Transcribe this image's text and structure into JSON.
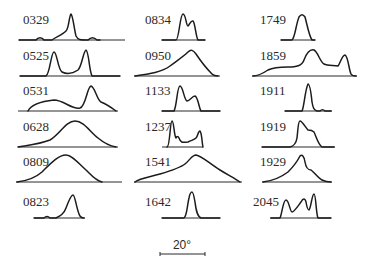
{
  "figure": {
    "type": "panel-grid",
    "scale_bar": {
      "label": "20°",
      "x1": 160,
      "x2": 205,
      "y": 254,
      "label_x": 182,
      "label_y": 249
    },
    "panels": [
      {
        "id": "0329",
        "label": "0329",
        "lx": 23,
        "ly": 24,
        "base": [
          19,
          125,
          40
        ],
        "path": "M19,40 L36,40 C38,37 42,37 44,40 L52,40 C56,37 62,35 66,31 C69,28 69,16 71,14 C73,16 74,28 76,36 C78,40 80,40 88,40 C91,37 94,37 97,40 L100,40"
      },
      {
        "id": "0525",
        "label": "0525",
        "lx": 23,
        "ly": 60,
        "base": [
          20,
          120,
          76
        ],
        "path": "M20,76 L46,76 C50,74 51,52 54,52 C57,52 58,70 62,72 C66,74 72,74 78,70 C82,66 83,52 86,50 C89,52 89,70 92,76 L120,76"
      },
      {
        "id": "0531",
        "label": "0531",
        "lx": 23,
        "ly": 95,
        "base": [
          18,
          118,
          111
        ],
        "path": "M28,111 C32,103 44,101 54,100 C64,100 72,110 80,108 C86,106 87,87 91,86 C95,87 97,100 101,102 C106,104 112,108 116,111"
      },
      {
        "id": "0628",
        "label": "0628",
        "lx": 23,
        "ly": 131,
        "base": [
          18,
          118,
          147
        ],
        "path": "M18,147 C30,145 40,144 50,140 C60,134 66,121 75,121 C84,121 90,132 98,138 C104,143 110,146 116,147"
      },
      {
        "id": "0809",
        "label": "0809",
        "lx": 23,
        "ly": 166,
        "base": [
          16,
          122,
          182
        ],
        "path": "M17,182 C26,181 34,179 42,172 C50,164 58,155 66,155 C72,155 78,163 86,170 C92,176 96,181 102,182"
      },
      {
        "id": "0823",
        "label": "0823",
        "lx": 23,
        "ly": 206,
        "base": [
          34,
          85,
          218
        ],
        "path": "M34,218 L44,218 C46,216 48,216 50,218 L56,218 C60,216 64,214 66,208 C69,200 71,195 73,195 C75,195 76,206 79,214 C80,217 82,218 84,218"
      },
      {
        "id": "0834",
        "label": "0834",
        "lx": 145,
        "ly": 24,
        "base": [
          162,
          205,
          40
        ],
        "path": "M162,40 L176,40 C179,40 180,14 183,14 C186,14 186,26 188,26 C190,24 191,20 193,21 C195,22 196,38 198,40 L205,40"
      },
      {
        "id": "0950",
        "label": "0950",
        "lx": 145,
        "ly": 60,
        "base": [
          134,
          220,
          76
        ],
        "path": "M135,76 C150,74 162,72 170,66 C178,60 184,56 188,52 C191,49 193,50 196,54 C200,60 206,68 212,74 C214,76 216,76 218,76"
      },
      {
        "id": "0950b",
        "label": "",
        "lx": 0,
        "ly": 0,
        "base": [
          0,
          0,
          0
        ],
        "path": ""
      },
      {
        "id": "1133",
        "label": "1133",
        "lx": 145,
        "ly": 95,
        "base": [
          162,
          220,
          111
        ],
        "path": "M162,111 L174,111 C177,106 177,86 180,86 C183,86 184,100 187,101 C190,101 192,96 195,96 C198,97 199,108 201,111 L220,111"
      },
      {
        "id": "1237",
        "label": "1237",
        "lx": 145,
        "ly": 131,
        "base": [
          162,
          203,
          147
        ],
        "path": "M167,147 C170,147 170,121 172,121 C174,121 174,136 176,138 C177,136 178,136 179,138 C181,144 184,142 188,142 C192,140 194,140 196,138 C198,136 198,131 200,131 C202,133 202,144 203,147"
      },
      {
        "id": "1541",
        "label": "1541",
        "lx": 145,
        "ly": 166,
        "base": [
          134,
          242,
          182
        ],
        "path": "M135,182 C140,178 150,177 160,174 C170,171 180,168 185,164 C190,160 192,155 196,155 C202,156 210,164 220,170 C228,175 234,178 240,182"
      },
      {
        "id": "1642",
        "label": "1642",
        "lx": 145,
        "ly": 206,
        "base": [
          162,
          220,
          218
        ],
        "path": "M162,218 L184,218 C187,216 187,206 189,198 C190,193 191,192 192,192 C193,192 194,196 195,202 C196,210 197,216 201,218 L220,218"
      },
      {
        "id": "1749",
        "label": "1749",
        "lx": 260,
        "ly": 24,
        "base": [
          281,
          315,
          40
        ],
        "path": "M281,40 L292,40 C295,38 296,24 299,17 C301,14 303,14 305,17 C307,24 309,36 312,40 L315,40"
      },
      {
        "id": "1859",
        "label": "1859",
        "lx": 260,
        "ly": 60,
        "base": [
          252,
          357,
          76
        ],
        "path": "M253,76 C258,76 262,74 268,70 C274,67 280,67 288,67 C296,67 302,66 304,60 C307,52 310,49 314,50 C318,52 320,62 324,64 C328,66 334,65 338,66 C340,64 342,55 345,55 C348,56 349,70 351,74 C352,76 354,76 356,76"
      },
      {
        "id": "1911",
        "label": "1911",
        "lx": 260,
        "ly": 95,
        "base": [
          285,
          332,
          111
        ],
        "path": "M285,111 L302,111 C304,108 305,90 308,84 C310,84 311,92 312,102 C313,108 314,110 317,111 L320,111 C322,109 323,109 325,111 L331,111"
      },
      {
        "id": "1919",
        "label": "1919",
        "lx": 260,
        "ly": 131,
        "base": [
          262,
          335,
          147
        ],
        "path": "M262,147 L290,147 C294,146 296,144 297,138 C298,130 298,121 300,121 C302,121 306,128 308,130 C310,130 312,130 314,132 C316,136 318,144 322,147 L334,147"
      },
      {
        "id": "1929",
        "label": "1929",
        "lx": 260,
        "ly": 166,
        "base": [
          262,
          332,
          182
        ],
        "path": "M263,182 C272,181 280,178 288,172 C294,166 298,160 300,156 C302,154 304,156 305,162 C306,168 308,170 311,170 C314,172 318,178 322,180 C326,182 328,182 331,182"
      },
      {
        "id": "2045",
        "label": "2045",
        "lx": 253,
        "ly": 206,
        "base": [
          270,
          331,
          218
        ],
        "path": "M271,218 L280,218 C282,214 283,200 286,200 C289,200 290,212 292,212 C294,212 298,206 301,202 C303,198 305,198 306,202 C307,208 308,210 309,210 C311,208 312,194 314,194 C316,194 316,214 318,218 L331,218"
      }
    ]
  }
}
